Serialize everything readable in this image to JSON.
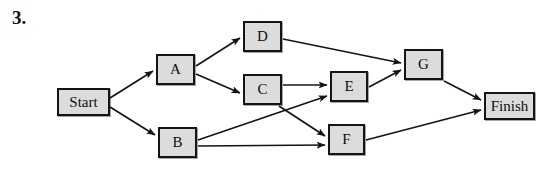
{
  "problem": {
    "number_label": "3."
  },
  "diagram": {
    "kind": "directed-activity-network",
    "canvas": {
      "width": 545,
      "height": 170
    },
    "style": {
      "node_fill": "#dcdcdc",
      "node_border": "#141414",
      "edge_color": "#141414",
      "background": "#ffffff"
    },
    "nodes": [
      {
        "id": "start",
        "label": "Start",
        "x": 57,
        "y": 88,
        "w": 53,
        "h": 28
      },
      {
        "id": "a",
        "label": "A",
        "x": 156,
        "y": 54,
        "w": 39,
        "h": 31
      },
      {
        "id": "b",
        "label": "B",
        "x": 158,
        "y": 127,
        "w": 39,
        "h": 31
      },
      {
        "id": "c",
        "label": "C",
        "x": 243,
        "y": 74,
        "w": 39,
        "h": 31
      },
      {
        "id": "d",
        "label": "D",
        "x": 243,
        "y": 21,
        "w": 39,
        "h": 31
      },
      {
        "id": "e",
        "label": "E",
        "x": 330,
        "y": 71,
        "w": 38,
        "h": 31
      },
      {
        "id": "f",
        "label": "F",
        "x": 328,
        "y": 124,
        "w": 37,
        "h": 31
      },
      {
        "id": "g",
        "label": "G",
        "x": 404,
        "y": 49,
        "w": 39,
        "h": 31
      },
      {
        "id": "finish",
        "label": "Finish",
        "x": 484,
        "y": 92,
        "w": 51,
        "h": 28
      }
    ],
    "edges": [
      {
        "from": "start",
        "to": "a",
        "x1": 110,
        "y1": 98,
        "x2": 153,
        "y2": 71
      },
      {
        "from": "start",
        "to": "b",
        "x1": 110,
        "y1": 107,
        "x2": 155,
        "y2": 135
      },
      {
        "from": "a",
        "to": "d",
        "x1": 196,
        "y1": 66,
        "x2": 240,
        "y2": 38
      },
      {
        "from": "a",
        "to": "c",
        "x1": 196,
        "y1": 74,
        "x2": 240,
        "y2": 93
      },
      {
        "from": "d",
        "to": "g",
        "x1": 283,
        "y1": 39,
        "x2": 401,
        "y2": 63
      },
      {
        "from": "c",
        "to": "e",
        "x1": 283,
        "y1": 85,
        "x2": 327,
        "y2": 85
      },
      {
        "from": "c",
        "to": "f",
        "x1": 279,
        "y1": 106,
        "x2": 325,
        "y2": 136
      },
      {
        "from": "b",
        "to": "e",
        "x1": 198,
        "y1": 140,
        "x2": 327,
        "y2": 96
      },
      {
        "from": "b",
        "to": "f",
        "x1": 198,
        "y1": 146,
        "x2": 325,
        "y2": 145
      },
      {
        "from": "e",
        "to": "g",
        "x1": 369,
        "y1": 87,
        "x2": 401,
        "y2": 70
      },
      {
        "from": "g",
        "to": "finish",
        "x1": 444,
        "y1": 81,
        "x2": 481,
        "y2": 100
      },
      {
        "from": "f",
        "to": "finish",
        "x1": 366,
        "y1": 140,
        "x2": 481,
        "y2": 110
      }
    ]
  }
}
